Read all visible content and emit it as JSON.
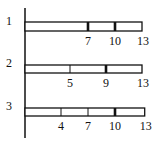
{
  "diagram": {
    "type": "segmented-bars",
    "axis": {
      "x": 25,
      "y_top": 8,
      "y_bottom": 138
    },
    "scale": {
      "min": 0,
      "max": 13,
      "x0": 25,
      "px_per_unit": 9.0
    },
    "rows": [
      {
        "label": "1",
        "bar_top": 22,
        "bar_height": 9,
        "end": 13,
        "ticks": [
          {
            "value": 7,
            "label": "7",
            "thick": true
          },
          {
            "value": 10,
            "label": "10",
            "thick": true
          }
        ],
        "end_label": "13"
      },
      {
        "label": "2",
        "bar_top": 65,
        "bar_height": 8,
        "end": 13,
        "ticks": [
          {
            "value": 5,
            "label": "5",
            "thick": false
          },
          {
            "value": 9,
            "label": "9",
            "thick": true
          }
        ],
        "end_label": "13"
      },
      {
        "label": "3",
        "bar_top": 108,
        "bar_height": 8,
        "end": 13.3,
        "ticks": [
          {
            "value": 4,
            "label": "4",
            "thick": false
          },
          {
            "value": 7,
            "label": "7",
            "thick": false
          },
          {
            "value": 10,
            "label": "10",
            "thick": true
          }
        ],
        "end_label": "13"
      }
    ]
  }
}
